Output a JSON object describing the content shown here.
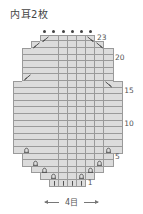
{
  "title": "内耳2枚",
  "footer": {
    "label": "4目"
  },
  "grid": {
    "origin_x": 13,
    "cell_w": 9.1,
    "row_h": 6.6,
    "row1_top": 180,
    "cols": 12
  },
  "legend_symbols": {
    "K": "knit (|)",
    "I": "twisted increase (Ω)",
    "L": "left-leaning decrease (⟋)",
    "R": "right-leaning decrease (⟍)",
    "B": "plain cell",
    "D": "bind-off dot above"
  },
  "row_labels": [
    {
      "row": 1,
      "text": "1"
    },
    {
      "row": 5,
      "text": "5"
    },
    {
      "row": 10,
      "text": "10"
    },
    {
      "row": 15,
      "text": "15"
    },
    {
      "row": 20,
      "text": "20"
    },
    {
      "row": 23,
      "text": "23"
    }
  ],
  "rows": [
    {
      "row": 1,
      "start": 4,
      "cells": [
        "K",
        "K",
        "K",
        "K"
      ]
    },
    {
      "row": 2,
      "start": 3,
      "cells": [
        "B",
        "I",
        "B",
        "B",
        "I",
        "B"
      ]
    },
    {
      "row": 3,
      "start": 2,
      "cells": [
        "B",
        "I",
        "B",
        "B",
        "B",
        "B",
        "I",
        "B"
      ]
    },
    {
      "row": 4,
      "start": 1,
      "cells": [
        "B",
        "I",
        "B",
        "B",
        "B",
        "B",
        "B",
        "B",
        "I",
        "B"
      ]
    },
    {
      "row": 5,
      "start": 1,
      "cells": [
        "B",
        "B",
        "B",
        "B",
        "B",
        "B",
        "B",
        "B",
        "B",
        "B"
      ]
    },
    {
      "row": 6,
      "start": 0,
      "cells": [
        "B",
        "I",
        "B",
        "B",
        "B",
        "B",
        "B",
        "B",
        "B",
        "B",
        "I",
        "B"
      ]
    },
    {
      "row": 7,
      "start": 0,
      "cells": [
        "B",
        "B",
        "B",
        "B",
        "B",
        "B",
        "B",
        "B",
        "B",
        "B",
        "B",
        "B"
      ]
    },
    {
      "row": 8,
      "start": 0,
      "cells": [
        "B",
        "B",
        "B",
        "B",
        "B",
        "B",
        "B",
        "B",
        "B",
        "B",
        "B",
        "B"
      ]
    },
    {
      "row": 9,
      "start": 0,
      "cells": [
        "B",
        "B",
        "B",
        "B",
        "B",
        "B",
        "B",
        "B",
        "B",
        "B",
        "B",
        "B"
      ]
    },
    {
      "row": 10,
      "start": 0,
      "cells": [
        "B",
        "B",
        "B",
        "B",
        "B",
        "B",
        "B",
        "B",
        "B",
        "B",
        "B",
        "B"
      ]
    },
    {
      "row": 11,
      "start": 0,
      "cells": [
        "B",
        "B",
        "B",
        "B",
        "B",
        "B",
        "B",
        "B",
        "B",
        "B",
        "B",
        "B"
      ]
    },
    {
      "row": 12,
      "start": 0,
      "cells": [
        "B",
        "B",
        "B",
        "B",
        "B",
        "B",
        "B",
        "B",
        "B",
        "B",
        "B",
        "B"
      ]
    },
    {
      "row": 13,
      "start": 0,
      "cells": [
        "B",
        "B",
        "B",
        "B",
        "B",
        "B",
        "B",
        "B",
        "B",
        "B",
        "B",
        "B"
      ]
    },
    {
      "row": 14,
      "start": 0,
      "cells": [
        "B",
        "B",
        "B",
        "B",
        "B",
        "B",
        "B",
        "B",
        "B",
        "B",
        "B",
        "B"
      ]
    },
    {
      "row": 15,
      "start": 0,
      "cells": [
        "B",
        "B",
        "B",
        "B",
        "B",
        "B",
        "B",
        "B",
        "B",
        "B",
        "B",
        "B"
      ]
    },
    {
      "row": 16,
      "start": 0,
      "cells": [
        "B",
        "B",
        "B",
        "B",
        "B",
        "B",
        "B",
        "B",
        "B",
        "B",
        "R",
        "B"
      ]
    },
    {
      "row": 17,
      "start": 1,
      "cells": [
        "L",
        "B",
        "B",
        "B",
        "B",
        "B",
        "B",
        "B",
        "B",
        "B"
      ]
    },
    {
      "row": 18,
      "start": 1,
      "cells": [
        "B",
        "B",
        "B",
        "B",
        "B",
        "B",
        "B",
        "B",
        "B",
        "B"
      ]
    },
    {
      "row": 19,
      "start": 1,
      "cells": [
        "B",
        "B",
        "B",
        "B",
        "B",
        "B",
        "B",
        "B",
        "B",
        "B"
      ]
    },
    {
      "row": 20,
      "start": 1,
      "cells": [
        "B",
        "B",
        "B",
        "B",
        "B",
        "B",
        "B",
        "B",
        "B",
        "B"
      ]
    },
    {
      "row": 21,
      "start": 1,
      "cells": [
        "B",
        "B",
        "B",
        "B",
        "B",
        "B",
        "B",
        "B",
        "B",
        "B"
      ]
    },
    {
      "row": 22,
      "start": 2,
      "cells": [
        "L",
        "B",
        "B",
        "B",
        "B",
        "B",
        "B",
        "R"
      ]
    },
    {
      "row": 23,
      "start": 3,
      "cells": [
        "L",
        "B",
        "B",
        "B",
        "B",
        "R"
      ]
    }
  ],
  "top_dots": {
    "row": 23,
    "start": 3,
    "count": 6
  },
  "colors": {
    "cell": "#dcdcdc",
    "grid_line": "#9a9a9a",
    "symbol": "#444444",
    "text": "#555555"
  }
}
